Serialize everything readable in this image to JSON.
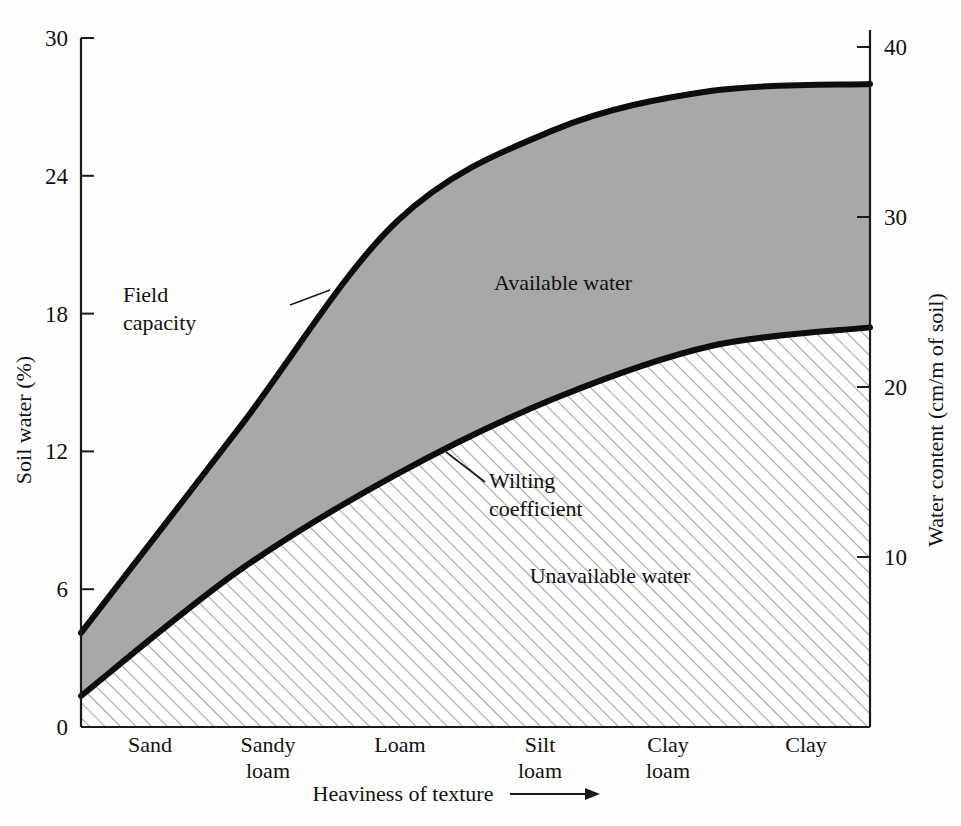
{
  "chart_data": {
    "type": "area",
    "title": "",
    "xlabel": "Heaviness of texture",
    "ylabel": "Soil water (%)",
    "y2label": "Water content (cm/m of soil)",
    "grid": false,
    "legend": "none",
    "categories": [
      "Sand",
      "Sandy loam",
      "Loam",
      "Silt loam",
      "Clay loam",
      "Clay"
    ],
    "category_lines": [
      [
        "Sand",
        ""
      ],
      [
        "Sandy",
        "loam"
      ],
      [
        "Loam",
        ""
      ],
      [
        "Silt",
        "loam"
      ],
      [
        "Clay",
        "loam"
      ],
      [
        "Clay",
        ""
      ]
    ],
    "ylim": [
      0,
      30
    ],
    "yticks": [
      0,
      6,
      12,
      18,
      24,
      30
    ],
    "ytick_labels": [
      "0",
      "6",
      "12",
      "18",
      "24",
      "30"
    ],
    "y2lim": [
      0,
      41
    ],
    "y2ticks": [
      10,
      20,
      30,
      40
    ],
    "y2tick_labels": [
      "10",
      "20",
      "30",
      "40"
    ],
    "x": [
      0,
      1,
      2,
      3,
      4,
      5
    ],
    "series": [
      {
        "name": "Field capacity",
        "values": [
          4.1,
          13.0,
          22.0,
          26.0,
          27.7,
          28.0
        ],
        "description": "upper boundary curve of available water"
      },
      {
        "name": "Wilting coefficient",
        "values": [
          1.35,
          6.8,
          11.0,
          14.3,
          16.6,
          17.4
        ],
        "description": "lower boundary curve of available water"
      }
    ],
    "regions": [
      {
        "name": "Available water",
        "between": [
          "Field capacity",
          "Wilting coefficient"
        ],
        "fill": "#a8a8a8"
      },
      {
        "name": "Unavailable water",
        "between": [
          "Wilting coefficient",
          "zero"
        ],
        "fill": "hatched"
      }
    ],
    "annotations": [
      {
        "name": "Field capacity",
        "lines": [
          "Field",
          "capacity"
        ],
        "points_to": "upper curve"
      },
      {
        "name": "Wilting coefficient",
        "lines": [
          "Wilting",
          "coefficient"
        ],
        "points_to": "lower curve"
      }
    ]
  },
  "colors": {
    "available_water_fill": "#a8a8a8",
    "unavailable_water_fill": "#ffffff",
    "hatch_stroke": "#9b9b9b",
    "curve_stroke": "#0d0d0d",
    "axis_stroke": "#1a1a1a",
    "background": "#fdfdfb",
    "text": "#111111"
  },
  "axes": {
    "left": {
      "title": "Soil water (%)",
      "ticks": [
        "0",
        "6",
        "12",
        "18",
        "24",
        "30"
      ]
    },
    "right": {
      "title": "Water content (cm/m of soil)",
      "ticks": [
        "10",
        "20",
        "30",
        "40"
      ]
    },
    "bottom": {
      "title": "Heaviness of texture",
      "arrow": "→",
      "ticks": [
        "Sand",
        "Sandy loam",
        "Loam",
        "Silt loam",
        "Clay loam",
        "Clay"
      ]
    }
  },
  "labels": {
    "available_water": "Available water",
    "unavailable_water": "Unavailable water",
    "field_capacity_line1": "Field",
    "field_capacity_line2": "capacity",
    "wilting_line1": "Wilting",
    "wilting_line2": "coefficient"
  }
}
